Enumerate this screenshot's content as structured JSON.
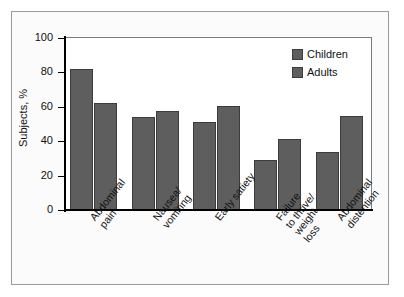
{
  "chart_data": {
    "type": "bar",
    "title": "",
    "xlabel": "",
    "ylabel": "Subjects, %",
    "ylim": [
      0,
      100
    ],
    "yticks": [
      0,
      20,
      40,
      60,
      80,
      100
    ],
    "ytick_labels": [
      "0",
      "20",
      "40",
      "60",
      "80",
      "100"
    ],
    "grid": false,
    "legend_position": "top-right",
    "categories": [
      "Abdominal\npain",
      "Nausea/\nvomiting",
      "Early satiety",
      "Failure\nto thrive/\nweight\nloss",
      "Abdominal\ndistention"
    ],
    "series": [
      {
        "name": "Children",
        "values": [
          82,
          54,
          51,
          29,
          33.5
        ]
      },
      {
        "name": "Adults",
        "values": [
          62,
          57.5,
          60.5,
          41,
          54.5
        ]
      }
    ],
    "colors": {
      "bar_fill": "#5e5e5e",
      "bar_edge": "#3c3c3c",
      "axis": "#000000",
      "plot_background": "#ffffff",
      "figure_background": "#fbfbfb",
      "frame_border": "#9a9a9a",
      "text": "#111111"
    }
  },
  "legend": {
    "items": [
      {
        "label": "Children"
      },
      {
        "label": "Adults"
      }
    ]
  }
}
